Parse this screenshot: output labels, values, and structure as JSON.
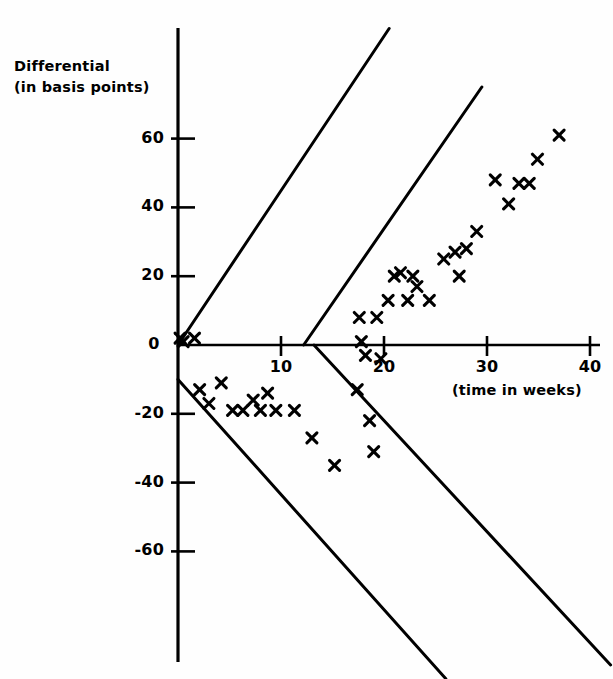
{
  "figure": {
    "y_axis_title_line1": "Differential",
    "y_axis_title_line2": "(in basis points)",
    "x_axis_title": "(time in weeks)"
  },
  "chart_data": {
    "type": "scatter",
    "title": "",
    "xlabel": "(time in weeks)",
    "ylabel": "Differential (in basis points)",
    "xlim": [
      0,
      40
    ],
    "ylim": [
      -75,
      75
    ],
    "grid": false,
    "legend": null,
    "marker": "x",
    "marker_color": "#000000",
    "xticks": [
      0,
      10,
      20,
      30,
      40
    ],
    "xtick_labels": [
      "0",
      "10",
      "20",
      "30",
      "40"
    ],
    "yticks": [
      60,
      40,
      20,
      -20,
      -40,
      -60
    ],
    "ytick_labels": [
      "60",
      "40",
      "20",
      "-20",
      "-40",
      "-60"
    ],
    "series": [
      {
        "name": "positive differential band",
        "points": [
          [
            0.2,
            2
          ],
          [
            0.5,
            1
          ],
          [
            1.6,
            2
          ],
          [
            17.8,
            1
          ],
          [
            17.6,
            8
          ],
          [
            19.3,
            8
          ],
          [
            20.4,
            13
          ],
          [
            21.0,
            20
          ],
          [
            21.6,
            21
          ],
          [
            22.8,
            20
          ],
          [
            23.2,
            17
          ],
          [
            22.3,
            13
          ],
          [
            24.4,
            13
          ],
          [
            25.8,
            25
          ],
          [
            26.9,
            27
          ],
          [
            28.0,
            28
          ],
          [
            27.3,
            20
          ],
          [
            29.0,
            33
          ],
          [
            30.8,
            48
          ],
          [
            32.1,
            41
          ],
          [
            33.1,
            47
          ],
          [
            34.1,
            47
          ],
          [
            34.9,
            54
          ],
          [
            37.0,
            61
          ]
        ]
      },
      {
        "name": "negative differential band",
        "points": [
          [
            2.1,
            -13
          ],
          [
            3.0,
            -17
          ],
          [
            4.2,
            -11
          ],
          [
            5.3,
            -19
          ],
          [
            6.3,
            -19
          ],
          [
            7.3,
            -16
          ],
          [
            8.0,
            -19
          ],
          [
            8.7,
            -14
          ],
          [
            9.5,
            -19
          ],
          [
            11.3,
            -19
          ],
          [
            13.0,
            -27
          ],
          [
            15.2,
            -35
          ],
          [
            17.4,
            -13
          ],
          [
            18.2,
            -3
          ],
          [
            18.6,
            -22
          ],
          [
            19.0,
            -31
          ],
          [
            19.7,
            -4
          ]
        ]
      }
    ],
    "boundary_lines": [
      {
        "name": "upper-outer-envelope",
        "x0": 0.0,
        "y0": 0,
        "x1": 20.5,
        "y1": 92
      },
      {
        "name": "upper-inner-envelope",
        "x0": 12.2,
        "y0": 0,
        "x1": 29.5,
        "y1": 75
      },
      {
        "name": "lower-outer-envelope",
        "x0": 0.0,
        "y0": -10,
        "x1": 26.0,
        "y1": -97
      },
      {
        "name": "lower-inner-envelope",
        "x0": 13.2,
        "y0": 0,
        "x1": 42.0,
        "y1": -93
      }
    ]
  }
}
